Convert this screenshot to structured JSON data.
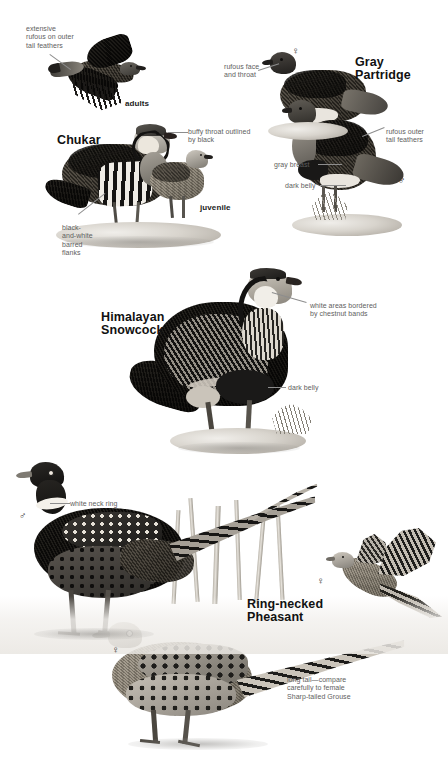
{
  "plate": {
    "width": 448,
    "height": 767,
    "background_color": "#ffffff"
  },
  "species_labels": [
    {
      "name": "chukar",
      "text": "Chukar",
      "x": 57,
      "y": 134
    },
    {
      "name": "gray-partridge",
      "text": "Gray\nPartridge",
      "x": 355,
      "y": 56
    },
    {
      "name": "himalayan-snowcock",
      "text": "Himalayan\nSnowcock",
      "x": 101,
      "y": 311
    },
    {
      "name": "ring-necked-pheasant",
      "text": "Ring-necked\nPheasant",
      "x": 247,
      "y": 598
    }
  ],
  "age_labels": [
    {
      "name": "chukar-adults",
      "text": "adults",
      "x": 125,
      "y": 99
    },
    {
      "name": "chukar-juvenile",
      "text": "juvenile",
      "x": 200,
      "y": 203
    }
  ],
  "captions": [
    {
      "name": "extensive-rufous-outer-tail-feathers",
      "text": "extensive\nrufous on outer\ntail feathers",
      "x": 26,
      "y": 25,
      "align": "left"
    },
    {
      "name": "buffy-throat-outlined-by-black",
      "text": "buffy throat outlined\nby black",
      "x": 188,
      "y": 128,
      "align": "left"
    },
    {
      "name": "black-and-white-barred-flanks",
      "text": "black-\nand-white\nbarred\nflanks",
      "x": 62,
      "y": 224,
      "align": "left"
    },
    {
      "name": "rufous-face-and-throat",
      "text": "rufous face\nand throat",
      "x": 224,
      "y": 63,
      "align": "left"
    },
    {
      "name": "rufous-outer-tail-feathers",
      "text": "rufous outer\ntail feathers",
      "x": 386,
      "y": 128,
      "align": "left"
    },
    {
      "name": "gray-breast",
      "text": "gray breast",
      "x": 274,
      "y": 161,
      "align": "left"
    },
    {
      "name": "dark-belly-partridge",
      "text": "dark belly",
      "x": 285,
      "y": 182,
      "align": "left"
    },
    {
      "name": "white-areas-bordered-by-chestnut-bands",
      "text": "white areas bordered\nby chestnut bands",
      "x": 310,
      "y": 302,
      "align": "left"
    },
    {
      "name": "dark-belly-snowcock",
      "text": "dark belly",
      "x": 288,
      "y": 384,
      "align": "left"
    },
    {
      "name": "white-neck-ring",
      "text": "white neck ring",
      "x": 70,
      "y": 500,
      "align": "left"
    },
    {
      "name": "long-tail-compare",
      "text": "long tail—compare\ncarefully to female\nSharp-tailed Grouse",
      "x": 287,
      "y": 676,
      "align": "left"
    }
  ],
  "sex_symbols": [
    {
      "name": "female-symbol-gray-partridge",
      "glyph": "♀",
      "x": 292,
      "y": 46
    },
    {
      "name": "male-symbol-gray-partridge",
      "glyph": "♂",
      "x": 398,
      "y": 176
    },
    {
      "name": "male-symbol-snowcock",
      "glyph": "♂",
      "x": 291,
      "y": 277
    },
    {
      "name": "male-symbol-pheasant",
      "glyph": "♂",
      "x": 19,
      "y": 511
    },
    {
      "name": "female-symbol-pheasant-flight",
      "glyph": "♀",
      "x": 317,
      "y": 576
    },
    {
      "name": "female-symbol-pheasant-ground",
      "glyph": "♀",
      "x": 112,
      "y": 645
    }
  ],
  "palette": {
    "caption_gray": "#5e5e5e",
    "label_black": "#111111",
    "leader_line": "#8d8d8d",
    "plumage_dark": "#201e1c",
    "plumage_mid": "#6f6b64",
    "plumage_light": "#cfcac0",
    "white_mark": "#f6f4f0"
  }
}
